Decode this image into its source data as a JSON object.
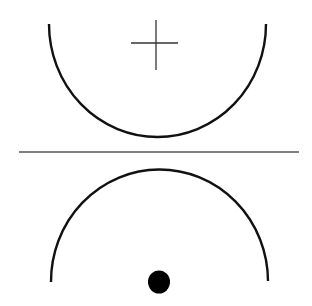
{
  "diagram": {
    "colors": {
      "background": "#ffffff",
      "stroke": "#111111",
      "divider": "#555555",
      "dot": "#000000"
    },
    "upper_arc": {
      "shape": "semicircle-open-up",
      "left": [
        49,
        24
      ],
      "right": [
        266,
        24
      ],
      "bottom_y": 137
    },
    "cross_marker": {
      "center": [
        156,
        43
      ],
      "vertical": [
        20,
        70
      ],
      "horizontal": [
        131,
        178
      ]
    },
    "divider_line": {
      "y": 152,
      "x_start": 19,
      "x_end": 299
    },
    "lower_arc": {
      "shape": "semicircle-open-down",
      "left": [
        51,
        282
      ],
      "right": [
        268,
        281
      ],
      "top_y": 169
    },
    "dot_marker": {
      "center": [
        159,
        282
      ],
      "radius": 11
    }
  }
}
